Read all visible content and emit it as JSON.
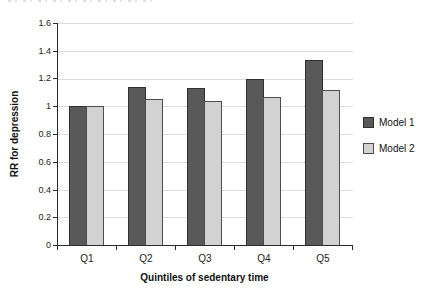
{
  "chart_data": {
    "type": "bar",
    "title": "",
    "categories": [
      "Q1",
      "Q2",
      "Q3",
      "Q4",
      "Q5"
    ],
    "series": [
      {
        "name": "Model 1",
        "color": "#595959",
        "border_color": "#303030",
        "values": [
          1.0,
          1.14,
          1.13,
          1.2,
          1.33
        ]
      },
      {
        "name": "Model 2",
        "color": "#d2d2d2",
        "border_color": "#4d4d4d",
        "values": [
          1.0,
          1.05,
          1.04,
          1.07,
          1.12
        ]
      }
    ],
    "xlabel": "Quintiles of sedentary time",
    "ylabel": "RR for depression",
    "ylim": [
      0,
      1.6
    ],
    "ytick_step": 0.2,
    "ytick_labels": [
      "0",
      "0.2",
      "0.4",
      "0.6",
      "0.8",
      "1",
      "1.2",
      "1.4",
      "1.6"
    ],
    "grid": true,
    "gridline_color": "#dcdcdc",
    "axis_color": "#2b2b2b",
    "legend_position": "right"
  }
}
